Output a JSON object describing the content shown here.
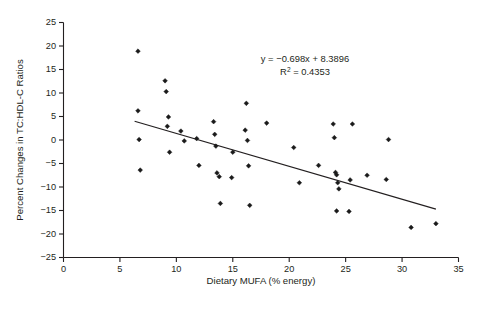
{
  "figure": {
    "background_color": "#ffffff",
    "marker_color": "#1a1a1a",
    "axis_color": "#231f20"
  },
  "annotations": {
    "equation": "y = −0.698x + 8.3896",
    "r_squared_prefix": "R",
    "r_squared_sup": "2",
    "r_squared_value": " = 0.4353"
  },
  "chart_data": {
    "type": "scatter",
    "title": "",
    "xlabel": "Dietary MUFA (% energy)",
    "ylabel": "Percent Changes in TC:HDL-C Ratios",
    "xlim": [
      0,
      35
    ],
    "ylim": [
      -25,
      25
    ],
    "xticks": [
      0,
      5,
      10,
      15,
      20,
      25,
      30,
      35
    ],
    "yticks": [
      -25,
      -20,
      -15,
      -10,
      -5,
      0,
      5,
      10,
      15,
      20,
      25
    ],
    "xtick_labels": [
      "0",
      "5",
      "10",
      "15",
      "20",
      "25",
      "30",
      "35"
    ],
    "ytick_labels": [
      "−25",
      "−20",
      "−15",
      "−10",
      "−5",
      "0",
      "5",
      "10",
      "15",
      "20",
      "25"
    ],
    "grid": false,
    "legend": "none",
    "annotation_text": "y = −0.698x + 8.3896 ; R² = 0.4353",
    "trendline": {
      "type": "linear",
      "slope": -0.698,
      "intercept": 8.3896,
      "r_squared": 0.4353,
      "x_start": 6.3,
      "x_end": 33.0,
      "y_start": 4.0,
      "y_end": -14.7
    },
    "points": [
      {
        "x": 6.6,
        "y": 18.9
      },
      {
        "x": 6.6,
        "y": 6.2
      },
      {
        "x": 6.7,
        "y": 0.1
      },
      {
        "x": 6.8,
        "y": -6.4
      },
      {
        "x": 9.0,
        "y": 12.6
      },
      {
        "x": 9.1,
        "y": 10.3
      },
      {
        "x": 9.3,
        "y": 4.9
      },
      {
        "x": 9.2,
        "y": 2.9
      },
      {
        "x": 9.4,
        "y": -2.6
      },
      {
        "x": 10.4,
        "y": 1.9
      },
      {
        "x": 10.7,
        "y": -0.2
      },
      {
        "x": 11.8,
        "y": 0.3
      },
      {
        "x": 12.0,
        "y": -5.4
      },
      {
        "x": 13.3,
        "y": 3.9
      },
      {
        "x": 13.4,
        "y": 1.2
      },
      {
        "x": 13.5,
        "y": -1.3
      },
      {
        "x": 13.6,
        "y": -7.0
      },
      {
        "x": 13.8,
        "y": -7.8
      },
      {
        "x": 13.9,
        "y": -13.5
      },
      {
        "x": 14.9,
        "y": -8.0
      },
      {
        "x": 15.0,
        "y": -2.6
      },
      {
        "x": 16.2,
        "y": 7.8
      },
      {
        "x": 16.1,
        "y": 2.1
      },
      {
        "x": 16.3,
        "y": -0.1
      },
      {
        "x": 16.4,
        "y": -5.5
      },
      {
        "x": 16.5,
        "y": -13.9
      },
      {
        "x": 18.0,
        "y": 3.6
      },
      {
        "x": 20.4,
        "y": -1.6
      },
      {
        "x": 20.9,
        "y": -9.1
      },
      {
        "x": 22.6,
        "y": -5.4
      },
      {
        "x": 23.9,
        "y": 3.4
      },
      {
        "x": 24.0,
        "y": 0.5
      },
      {
        "x": 24.1,
        "y": -6.9
      },
      {
        "x": 24.2,
        "y": -7.4
      },
      {
        "x": 24.3,
        "y": -9.1
      },
      {
        "x": 24.4,
        "y": -10.4
      },
      {
        "x": 24.2,
        "y": -15.1
      },
      {
        "x": 25.4,
        "y": -8.5
      },
      {
        "x": 25.3,
        "y": -15.2
      },
      {
        "x": 25.6,
        "y": 3.4
      },
      {
        "x": 26.9,
        "y": -7.5
      },
      {
        "x": 28.8,
        "y": 0.1
      },
      {
        "x": 28.6,
        "y": -8.4
      },
      {
        "x": 30.8,
        "y": -18.6
      },
      {
        "x": 33.0,
        "y": -17.8
      }
    ]
  }
}
